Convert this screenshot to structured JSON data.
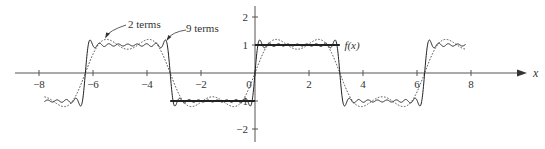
{
  "chart_data": {
    "type": "line",
    "title": "",
    "xlabel": "x",
    "ylabel": "",
    "xlim": [
      -8.5,
      9.7
    ],
    "ylim": [
      -2.3,
      2.3
    ],
    "grid": false,
    "legend_position": "annotations",
    "x_ticks": [
      -8,
      -6,
      -4,
      -2,
      0,
      2,
      4,
      6,
      8
    ],
    "x_tick_labels": [
      "−8",
      "−6",
      "−4",
      "−2",
      "0",
      "2",
      "4",
      "6",
      "8"
    ],
    "y_ticks": [
      2,
      1,
      -1,
      -2
    ],
    "y_tick_labels": [
      "2",
      "1",
      "−1",
      "−2"
    ],
    "series": [
      {
        "name": "f(x)",
        "description": "Square wave, period 2π: f(x) = 1 on (0, π), −1 on (−π, 0); drawn bold only on [−π, π]",
        "style": "thick-solid",
        "segments": [
          {
            "x": [
              -3.1416,
              0
            ],
            "y": [
              -1,
              -1
            ]
          },
          {
            "x": [
              0,
              3.1416
            ],
            "y": [
              1,
              1
            ]
          }
        ]
      },
      {
        "name": "9 terms",
        "description": "Fourier partial sum (4/π) Σ_{k=1..9} sin((2k−1)x)/(2k−1)",
        "style": "solid",
        "terms": 9,
        "x_range": [
          -7.8,
          7.8
        ]
      },
      {
        "name": "2 terms",
        "description": "Fourier partial sum (4/π)(sin x + sin 3x / 3)",
        "style": "dotted",
        "terms": 2,
        "x_range": [
          -7.8,
          7.8
        ]
      }
    ],
    "annotations": [
      {
        "text": "2 terms",
        "target_series": "2 terms",
        "target_x": -5.55,
        "arrow": true
      },
      {
        "text": "9 terms",
        "target_series": "9 terms",
        "target_x": -3.32,
        "arrow": true
      },
      {
        "text": "f(x)",
        "target_series": "f(x)",
        "target_x": 3.2,
        "arrow": false
      }
    ]
  },
  "layout": {
    "origin_px": [
      255,
      73
    ],
    "px_per_unit_x": 27,
    "px_per_unit_y": 28,
    "x_axis_start_px": 15,
    "x_axis_end_px": 527,
    "y_axis_top_px": 6,
    "y_axis_bottom_px": 142,
    "colors": {
      "axis": "#555555",
      "curve": "#222222",
      "dotted": "#444444",
      "text": "#333333"
    }
  },
  "labels": {
    "x_axis": "x",
    "two_terms": "2 terms",
    "nine_terms": "9 terms",
    "fx": "f(x)"
  }
}
